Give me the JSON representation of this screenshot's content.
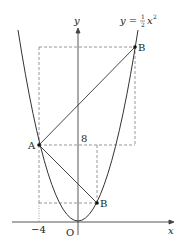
{
  "figure": {
    "curve_label_prefix": "y = ",
    "curve_label_num": "1",
    "curve_label_den": "2",
    "curve_label_var": "x",
    "curve_label_exp": "2",
    "y_axis_label": "y",
    "x_axis_label": "x",
    "origin_label": "O",
    "tick_x_label": "−4",
    "tick_y_label": "8",
    "point_A_label": "A",
    "point_B_upper_label": "B",
    "point_B_lower_label": "B"
  },
  "colors": {
    "stroke": "#333333",
    "dashed": "#888888",
    "point": "#111111"
  }
}
